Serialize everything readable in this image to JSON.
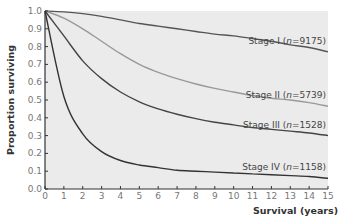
{
  "chart_data": {
    "type": "line",
    "title": "",
    "xlabel": "Survival (years)",
    "ylabel": "Proportion surviving",
    "xlim": [
      0,
      15
    ],
    "ylim": [
      0,
      1.0
    ],
    "x_ticks": [
      "0",
      "1",
      "2",
      "3",
      "4",
      "5",
      "6",
      "7",
      "8",
      "9",
      "10",
      "11",
      "12",
      "13",
      "14",
      "15"
    ],
    "y_ticks": [
      "0.0",
      "0.1",
      "0.2",
      "0.3",
      "0.4",
      "0.5",
      "0.6",
      "0.7",
      "0.8",
      "0.9",
      "1.0"
    ],
    "grid": false,
    "background": "#ebebeb",
    "x": [
      0,
      1,
      2,
      3,
      4,
      5,
      6,
      7,
      8,
      9,
      10,
      11,
      12,
      13,
      14,
      15
    ],
    "series": [
      {
        "name": "Stage I",
        "n": "9175",
        "color": "#555555",
        "values": [
          1.0,
          0.995,
          0.985,
          0.97,
          0.95,
          0.93,
          0.915,
          0.9,
          0.885,
          0.87,
          0.86,
          0.845,
          0.83,
          0.81,
          0.795,
          0.77
        ]
      },
      {
        "name": "Stage II",
        "n": "5739",
        "color": "#999999",
        "values": [
          1.0,
          0.96,
          0.9,
          0.83,
          0.76,
          0.7,
          0.655,
          0.62,
          0.59,
          0.565,
          0.545,
          0.525,
          0.51,
          0.5,
          0.485,
          0.465
        ]
      },
      {
        "name": "Stage III",
        "n": "1528",
        "color": "#444444",
        "values": [
          1.0,
          0.86,
          0.72,
          0.62,
          0.545,
          0.49,
          0.45,
          0.42,
          0.395,
          0.375,
          0.36,
          0.345,
          0.335,
          0.325,
          0.315,
          0.3
        ]
      },
      {
        "name": "Stage IV",
        "n": "1158",
        "color": "#333333",
        "values": [
          1.0,
          0.52,
          0.31,
          0.21,
          0.16,
          0.135,
          0.12,
          0.105,
          0.1,
          0.095,
          0.09,
          0.085,
          0.08,
          0.075,
          0.07,
          0.06
        ]
      }
    ]
  }
}
